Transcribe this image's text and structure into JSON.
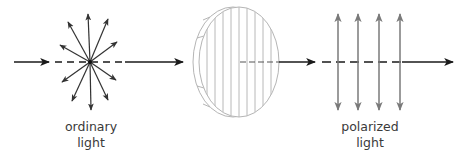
{
  "diagram": {
    "labels": {
      "input": [
        "ordinary",
        "light"
      ],
      "output": [
        "polarized",
        "light"
      ]
    },
    "elements": {
      "input_beam": "light-ray-arrow",
      "unpolarized_vectors": "star-burst-arrows",
      "filter": "polarizing-filter-disc",
      "polarized_vectors": "vertical-double-arrows",
      "output_beam": "light-ray-arrow"
    },
    "colors": {
      "ray": "#1a1a1a",
      "polarized_vectors": "#7a7a7a",
      "filter_lines": "#b5b5b5",
      "label_text": "#3a3a3a"
    }
  }
}
